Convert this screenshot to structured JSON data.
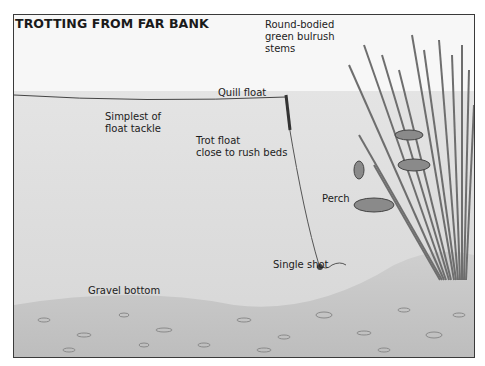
{
  "diagram": {
    "title": "TROTTING FROM FAR BANK",
    "labels": {
      "bulrush": "Round-bodied\ngreen bulrush\nstems",
      "quill_float": "Quill float",
      "simplest": "Simplest of\nfloat tackle",
      "trot_float": "Trot float\nclose to rush beds",
      "perch": "Perch",
      "single_shot": "Single shot",
      "gravel": "Gravel bottom"
    },
    "colors": {
      "sky": "#f7f7f7",
      "water": "#dcdcdc",
      "gravel": "#c8c8c8",
      "reeds": "#6e6e6e",
      "frame": "#3a3a3a"
    }
  }
}
